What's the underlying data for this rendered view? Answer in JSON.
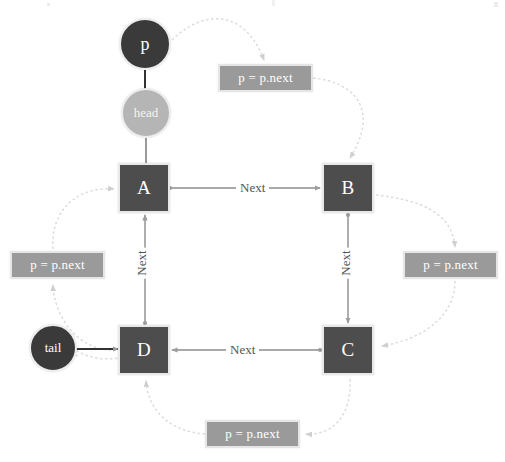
{
  "diagram": {
    "type": "linked-list-traversal",
    "colors": {
      "node_fill": "#4d4d4d",
      "node_border": "#e8e8e8",
      "pointer_dark": "#3a3a3a",
      "pointer_light": "#b5b5b5",
      "label_fill": "#9a9a9a",
      "label_border": "#e6e6e6",
      "edge": "#8c8c8c",
      "curve": "#d9d9d9",
      "text_on_dark": "#ffffff",
      "edge_label_text": "#555555",
      "background": "#ffffff"
    }
  },
  "nodes": [
    {
      "id": "A",
      "label": "A",
      "x": 118,
      "y": 163,
      "w": 52,
      "h": 50
    },
    {
      "id": "B",
      "label": "B",
      "x": 322,
      "y": 163,
      "w": 52,
      "h": 50
    },
    {
      "id": "C",
      "label": "C",
      "x": 322,
      "y": 325,
      "w": 52,
      "h": 50
    },
    {
      "id": "D",
      "label": "D",
      "x": 118,
      "y": 325,
      "w": 52,
      "h": 50
    }
  ],
  "pointers": [
    {
      "id": "p",
      "label": "p",
      "style": "dark",
      "x": 119,
      "y": 18,
      "d": 52
    },
    {
      "id": "head",
      "label": "head",
      "style": "light",
      "x": 121,
      "y": 88,
      "d": 50
    },
    {
      "id": "tail",
      "label": "tail",
      "style": "dark",
      "x": 29,
      "y": 324,
      "d": 48
    }
  ],
  "edge_labels": [
    {
      "id": "next-a-b",
      "text": "Next",
      "orientation": "horizontal",
      "x": 236,
      "y": 180
    },
    {
      "id": "next-c-d",
      "text": "Next",
      "orientation": "horizontal",
      "x": 226,
      "y": 342
    },
    {
      "id": "next-d-a",
      "text": "Next",
      "orientation": "vertical",
      "x": 126,
      "y": 255
    },
    {
      "id": "next-b-c",
      "text": "Next",
      "orientation": "vertical",
      "x": 330,
      "y": 255
    }
  ],
  "step_labels": [
    {
      "id": "pnext-top",
      "text": "p = p.next",
      "x": 218,
      "y": 64,
      "w": 95,
      "h": 28
    },
    {
      "id": "pnext-right",
      "text": "p = p.next",
      "x": 403,
      "y": 251,
      "w": 95,
      "h": 28
    },
    {
      "id": "pnext-bottom",
      "text": "p = p.next",
      "x": 205,
      "y": 420,
      "w": 95,
      "h": 28
    },
    {
      "id": "pnext-left",
      "text": "p = p.next",
      "x": 10,
      "y": 251,
      "w": 95,
      "h": 28
    }
  ],
  "connections": [
    {
      "from": "p",
      "to": "head",
      "kind": "solid-vertical"
    },
    {
      "from": "head",
      "to": "A",
      "kind": "solid-vertical"
    },
    {
      "from": "tail",
      "to": "D",
      "kind": "solid-horizontal"
    },
    {
      "from": "A",
      "to": "B",
      "kind": "next-arrow",
      "label": "Next"
    },
    {
      "from": "B",
      "to": "C",
      "kind": "next-arrow",
      "label": "Next"
    },
    {
      "from": "C",
      "to": "D",
      "kind": "next-arrow",
      "label": "Next"
    },
    {
      "from": "D",
      "to": "A",
      "kind": "next-arrow",
      "label": "Next"
    },
    {
      "from": "p",
      "to": "pnext-top",
      "kind": "dotted-curve"
    },
    {
      "from": "pnext-top",
      "to": "B",
      "kind": "dotted-curve"
    },
    {
      "from": "B",
      "to": "pnext-right",
      "kind": "dotted-curve"
    },
    {
      "from": "pnext-right",
      "to": "C",
      "kind": "dotted-curve"
    },
    {
      "from": "C",
      "to": "pnext-bottom",
      "kind": "dotted-curve"
    },
    {
      "from": "pnext-bottom",
      "to": "D",
      "kind": "dotted-curve"
    },
    {
      "from": "D",
      "to": "pnext-left",
      "kind": "dotted-curve"
    },
    {
      "from": "pnext-left",
      "to": "A",
      "kind": "dotted-curve"
    }
  ]
}
